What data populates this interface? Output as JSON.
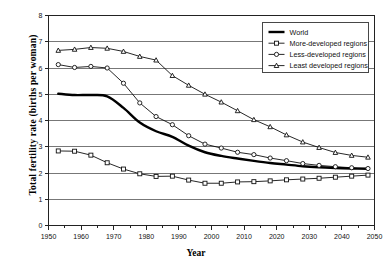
{
  "chart_data": {
    "type": "line",
    "title": "",
    "xlabel": "Year",
    "ylabel": "Total fertility rate (births per woman)",
    "xlim": [
      1950,
      2050
    ],
    "ylim": [
      0,
      8
    ],
    "ytick_values": [
      0,
      1,
      2,
      3,
      4,
      5,
      6,
      7,
      8
    ],
    "ytick_labels": [
      "0",
      "1",
      "2",
      "3",
      "4",
      "5",
      "6",
      "7",
      "8"
    ],
    "xtick_values": [
      1950,
      1960,
      1970,
      1980,
      1990,
      2000,
      2010,
      2020,
      2030,
      2040,
      2050
    ],
    "xtick_labels": [
      "1950",
      "1960",
      "1970",
      "1980",
      "1990",
      "2000",
      "2010",
      "2020",
      "2030",
      "2040",
      "2050"
    ],
    "minor_xticks_every": 5,
    "grid": "horizontal",
    "legend_position": "top-right",
    "x": [
      1953,
      1958,
      1963,
      1968,
      1973,
      1978,
      1983,
      1988,
      1993,
      1998,
      2003,
      2008,
      2013,
      2018,
      2023,
      2028,
      2033,
      2038,
      2043,
      2048
    ],
    "series": [
      {
        "name": "World",
        "marker": "none",
        "style": "thick-solid",
        "color": "#000000",
        "values": [
          5.02,
          4.97,
          4.97,
          4.92,
          4.48,
          3.92,
          3.59,
          3.38,
          3.04,
          2.79,
          2.65,
          2.55,
          2.46,
          2.38,
          2.32,
          2.26,
          2.22,
          2.19,
          2.17,
          2.16
        ]
      },
      {
        "name": "More-developed regions",
        "marker": "square",
        "style": "thin-solid",
        "color": "#000000",
        "values": [
          2.84,
          2.83,
          2.68,
          2.39,
          2.15,
          1.97,
          1.87,
          1.88,
          1.73,
          1.61,
          1.61,
          1.66,
          1.67,
          1.7,
          1.74,
          1.77,
          1.8,
          1.84,
          1.88,
          1.92
        ]
      },
      {
        "name": "Less-developed regions",
        "marker": "circle",
        "style": "thin-solid",
        "color": "#000000",
        "values": [
          6.13,
          6.02,
          6.06,
          6.0,
          5.42,
          4.67,
          4.15,
          3.84,
          3.42,
          3.1,
          2.95,
          2.79,
          2.7,
          2.57,
          2.47,
          2.36,
          2.29,
          2.24,
          2.2,
          2.17
        ]
      },
      {
        "name": "Least developed regions",
        "marker": "triangle",
        "style": "thin-solid",
        "color": "#000000",
        "values": [
          6.67,
          6.71,
          6.78,
          6.75,
          6.63,
          6.44,
          6.3,
          5.71,
          5.34,
          5.0,
          4.7,
          4.37,
          4.03,
          3.76,
          3.45,
          3.18,
          2.97,
          2.78,
          2.67,
          2.6
        ]
      }
    ]
  },
  "legend": {
    "items": [
      {
        "label": "World"
      },
      {
        "label": "More-developed regions"
      },
      {
        "label": "Less-developed regions"
      },
      {
        "label": "Least developed regions"
      }
    ]
  }
}
